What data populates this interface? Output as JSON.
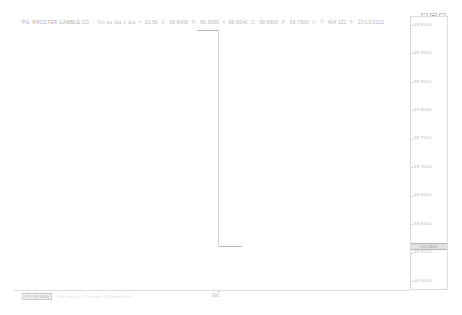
{
  "window": {
    "controls": [
      {
        "name": "minimize",
        "label": "_"
      },
      {
        "name": "maximize",
        "label": "□"
      },
      {
        "name": "close",
        "label": "×"
      }
    ]
  },
  "quote_bar": {
    "symbol": "PG",
    "company": "PROCTER  GAMBLE CO",
    "separator": "-",
    "period": "Fin de día 1 día",
    "equals": "=",
    "period_value": "23.59",
    "open_label": "A:",
    "open_value": "69.9400",
    "high_label": "H:",
    "high_value": "69.9000",
    "low_label": "=",
    "low_value": "69.5640",
    "close_label": "C:",
    "close_value": "69.5600",
    "prev_label": "P:",
    "prev_value": "69.7900",
    "vol_label": "V:",
    "total_label": "T:",
    "total_value": "404 222",
    "date_label": "F:",
    "date_value": "23/12/2012"
  },
  "legend": {
    "chip_label": "PG 69.5600",
    "note": "Fin de día  ·  Procter & Gamble Co"
  },
  "x_axis": {
    "tick_label": "Dic"
  },
  "current_price": {
    "value": "69.5600"
  },
  "chart_data": {
    "type": "ohlc",
    "title": "PG PROCTER GAMBLE CO - Fin de día 1 día",
    "xlabel": "",
    "ylabel": "",
    "grid": false,
    "legend_position": "bottom-left",
    "ylim": [
      69.5,
      69.95
    ],
    "y_ticks": [
      69.95,
      69.9,
      69.85,
      69.8,
      69.75,
      69.7,
      69.65,
      69.6,
      69.55,
      69.5
    ],
    "y_tick_labels": [
      "69.9500",
      "69.9000",
      "69.8500",
      "69.8000",
      "69.7500",
      "69.7000",
      "69.6500",
      "69.6000",
      "69.5500",
      "69.5000"
    ],
    "x": [
      "23/12/2012"
    ],
    "x_tick_labels": [
      "Dic"
    ],
    "series": [
      {
        "name": "PG",
        "open": [
          69.94
        ],
        "high": [
          69.9
        ],
        "low": [
          69.564
        ],
        "close": [
          69.56
        ],
        "volume": [
          404222
        ]
      }
    ],
    "annotations": [
      {
        "type": "price-marker",
        "value": 69.56,
        "label": "69.5600",
        "axis": "y"
      }
    ]
  }
}
